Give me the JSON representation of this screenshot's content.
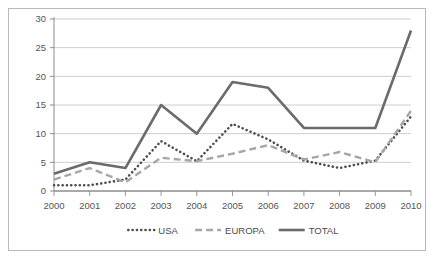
{
  "chart_data": {
    "type": "line",
    "title": "",
    "subtitle": "",
    "xlabel": "",
    "ylabel": "",
    "categories": [
      "2000",
      "2001",
      "2002",
      "2003",
      "2004",
      "2005",
      "2006",
      "2007",
      "2008",
      "2009",
      "2010"
    ],
    "xlim": [
      2000,
      2010
    ],
    "ylim": [
      0,
      30
    ],
    "yticks": [
      0,
      5,
      10,
      15,
      20,
      25,
      30
    ],
    "grid": "horizontal",
    "legend_position": "bottom",
    "series": [
      {
        "name": "USA",
        "style": "dotted",
        "color": "#4d4d4d",
        "values": [
          1,
          1,
          2,
          8.7,
          5.2,
          11.7,
          9,
          5.3,
          4,
          5.3,
          13
        ]
      },
      {
        "name": "EUROPA",
        "style": "dashed",
        "color": "#a6a6a6",
        "values": [
          2,
          4,
          1.5,
          5.8,
          5.2,
          6.5,
          8,
          5.5,
          6.8,
          5,
          14
        ]
      },
      {
        "name": "TOTAL",
        "style": "solid",
        "color": "#6b6b6b",
        "values": [
          3,
          5,
          4,
          15,
          10,
          19,
          18,
          11,
          11,
          11,
          28
        ]
      }
    ]
  },
  "legend": {
    "items": [
      {
        "label": "USA",
        "marker": "dotted-line-marker"
      },
      {
        "label": "EUROPA",
        "marker": "dashed-line-marker"
      },
      {
        "label": "TOTAL",
        "marker": "solid-line-marker"
      }
    ]
  },
  "axes": {
    "y_tick_labels": [
      "0",
      "5",
      "10",
      "15",
      "20",
      "25",
      "30"
    ],
    "x_tick_labels": [
      "2000",
      "2001",
      "2002",
      "2003",
      "2004",
      "2005",
      "2006",
      "2007",
      "2008",
      "2009",
      "2010"
    ]
  },
  "colors": {
    "frame_border": "#b9b9b9",
    "gridline": "#c8c8c8",
    "axis_line": "#8c8c8c",
    "tick_text": "#555555",
    "plot_background": "#ffffff",
    "series_usa": "#4d4d4d",
    "series_europa": "#a6a6a6",
    "series_total": "#6b6b6b"
  }
}
